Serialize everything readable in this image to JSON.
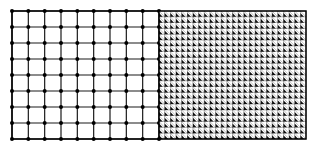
{
  "diagram": {
    "title": "",
    "bounds": {
      "left": 12,
      "top": 11,
      "right": 306,
      "bottom": 139,
      "split_x": 159
    },
    "left_mesh": {
      "type": "square-grid",
      "columns": 9,
      "rows": 8,
      "line_color": "#1a1a1a",
      "node_color": "#000000",
      "node_radius": 2
    },
    "right_mesh": {
      "type": "triangulated-grid",
      "columns": 26,
      "rows": 22,
      "line_color": "#000000",
      "fill_dark": "#111111",
      "fill_light": "#ffffff"
    },
    "colors": {
      "background": "#ffffff",
      "border": "#000000"
    }
  }
}
